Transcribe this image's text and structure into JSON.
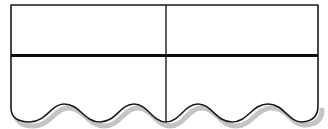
{
  "diagram": {
    "type": "wavy-bottom table shape",
    "columns": 2,
    "rows": 2,
    "colors": {
      "stroke": "#1a1a1a",
      "fill": "#ffffff",
      "shadow": "#bdbdbd"
    },
    "cells": [
      {
        "row": 0,
        "col": 0,
        "text": ""
      },
      {
        "row": 0,
        "col": 1,
        "text": ""
      },
      {
        "row": 1,
        "col": 0,
        "text": ""
      },
      {
        "row": 1,
        "col": 1,
        "text": ""
      }
    ]
  }
}
